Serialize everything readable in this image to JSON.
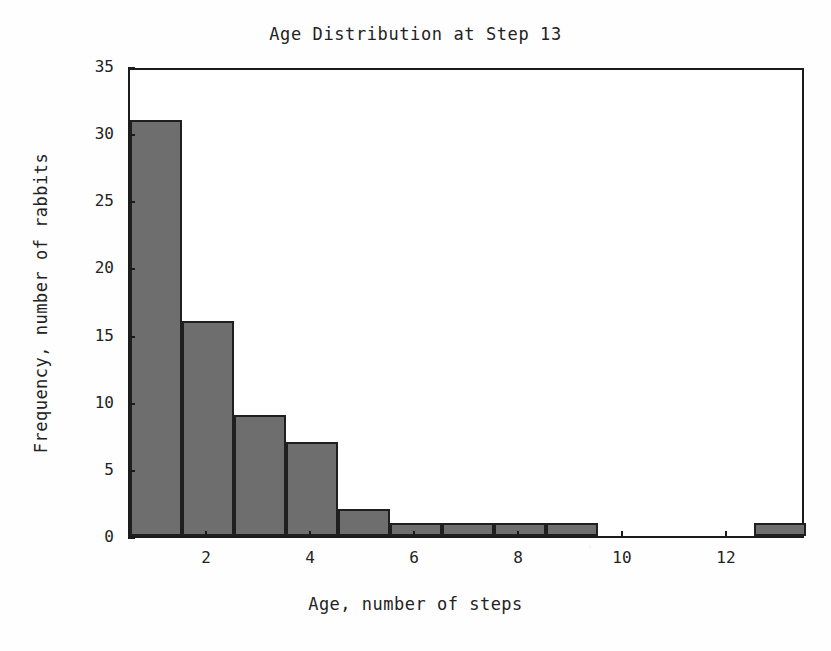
{
  "chart_data": {
    "type": "bar",
    "title": "Age Distribution at Step 13",
    "xlabel": "Age, number of steps",
    "ylabel": "Frequency, number of rabbits",
    "grid": false,
    "legend": null,
    "xlim": [
      0.5,
      13.5
    ],
    "ylim": [
      0,
      35
    ],
    "bin_width": 1,
    "categories": [
      1,
      2,
      3,
      4,
      5,
      6,
      7,
      8,
      9,
      10,
      11,
      12,
      13
    ],
    "values": [
      31,
      16,
      9,
      7,
      2,
      1,
      1,
      1,
      1,
      0,
      0,
      0,
      1
    ],
    "bar_edges": [
      0.5,
      1.5,
      2.5,
      3.5,
      4.5,
      5.5,
      6.5,
      7.5,
      8.5,
      9.5,
      10.5,
      11.5,
      12.5,
      13.5
    ],
    "xticks": [
      2,
      4,
      6,
      8,
      10,
      12
    ],
    "xticklabels": [
      "2",
      "4",
      "6",
      "8",
      "10",
      "12"
    ],
    "yticks": [
      0,
      5,
      10,
      15,
      20,
      25,
      30,
      35
    ],
    "yticklabels": [
      "0",
      "5",
      "10",
      "15",
      "20",
      "25",
      "30",
      "35"
    ],
    "bar_fill_color": "#6e6e6e",
    "bar_edge_color": "#1f1f1f",
    "axis_color": "#1b1b1b",
    "background_color": "#ffffff",
    "text_color": "#222222"
  }
}
